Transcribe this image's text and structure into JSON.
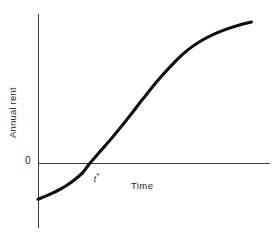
{
  "chart_data": {
    "type": "line",
    "title": "",
    "subtitle": "",
    "xlabel": "Time",
    "ylabel": "Annual rent",
    "ytick_labels": [
      "0"
    ],
    "xtick_labels": [],
    "grid": false,
    "legend": null,
    "annotations": [
      {
        "name": "zero-crossing",
        "text_main": "t",
        "text_sup": "*",
        "text": "t*",
        "x": 0.235,
        "y": 0.0
      }
    ],
    "axis_ranges": {
      "x": [
        0,
        1
      ],
      "y": [
        -0.25,
        1.0
      ]
    },
    "series": [
      {
        "name": "Annual rent over time",
        "shape": "sigmoid",
        "color": "#0d0d0d",
        "x": [
          0.0,
          0.05,
          0.1,
          0.15,
          0.2,
          0.235,
          0.28,
          0.34,
          0.41,
          0.48,
          0.55,
          0.62,
          0.68,
          0.74,
          0.8,
          0.86,
          0.92,
          0.97
        ],
        "y": [
          -0.235,
          -0.205,
          -0.17,
          -0.125,
          -0.065,
          0.0,
          0.075,
          0.175,
          0.3,
          0.43,
          0.555,
          0.665,
          0.745,
          0.805,
          0.85,
          0.885,
          0.912,
          0.93
        ]
      }
    ],
    "colors": {
      "curve": "#0d0d0d",
      "axis": "#3a3a3a",
      "text": "#2a2a2a",
      "background": "#ffffff"
    }
  },
  "labels": {
    "y_axis_title": "Annual rent",
    "x_axis_title": "Time",
    "origin_tick": "0",
    "critical_time_symbol": "t",
    "critical_time_superscript": "*"
  }
}
